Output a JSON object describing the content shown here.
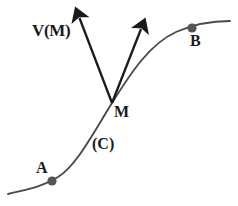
{
  "figure": {
    "type": "geometry-diagram",
    "background_color": "#ffffff",
    "stroke_color": "#3a3a3a",
    "arrow_color": "#1a1a1a",
    "point_color": "#555555",
    "labels": {
      "velocity_vector": "V(M)",
      "point_m": "M",
      "point_b": "B",
      "point_a": "A",
      "curve": "(C)"
    },
    "points": [
      {
        "name": "A",
        "label": "A",
        "x": 52,
        "y": 181
      },
      {
        "name": "M",
        "label": "M",
        "x": 112,
        "y": 103
      },
      {
        "name": "B",
        "label": "B",
        "x": 192,
        "y": 28
      }
    ],
    "vectors": [
      {
        "name": "velocity",
        "label": "V(M)",
        "from_x": 112,
        "from_y": 103,
        "to_x": 77,
        "to_y": 12
      },
      {
        "name": "tangent",
        "label": "",
        "from_x": 112,
        "from_y": 103,
        "to_x": 143,
        "to_y": 23
      }
    ],
    "curve": {
      "label": "(C)",
      "start_x": 8,
      "start_y": 194,
      "end_x": 230,
      "end_y": 21,
      "shape": "sigmoid-s-curve"
    }
  }
}
